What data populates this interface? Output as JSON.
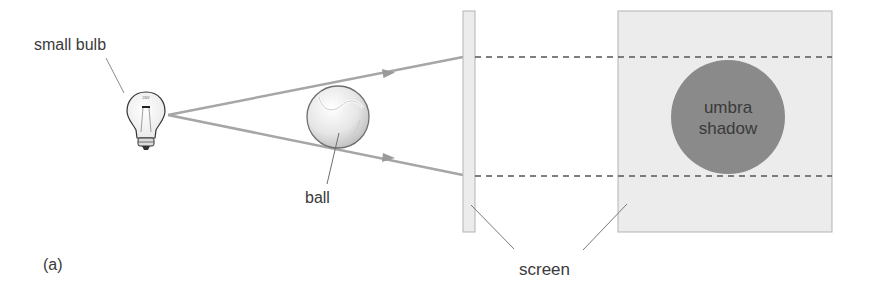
{
  "diagram": {
    "panel_label": "(a)",
    "labels": {
      "bulb": "small bulb",
      "ball": "ball",
      "screen": "screen",
      "umbra_line1": "umbra",
      "umbra_line2": "shadow"
    },
    "bulb_text": "230V",
    "colors": {
      "ray": "#a6a6a6",
      "screen_fill": "#ececec",
      "screen_stroke": "#b3b3b3",
      "umbra": "#8a8a8a",
      "dashed": "#555555",
      "text": "#3a3a3a"
    }
  }
}
